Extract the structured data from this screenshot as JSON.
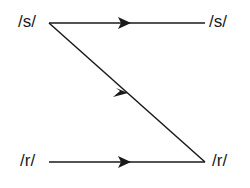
{
  "diagram": {
    "nodes": {
      "s_left": "/s/",
      "s_right": "/s/",
      "r_left": "/r/",
      "r_right": "/r/"
    },
    "edges": [
      {
        "from": "s_left",
        "to": "s_right",
        "direction": "right"
      },
      {
        "from": "s_left",
        "to": "r_right",
        "direction": "down-right"
      },
      {
        "from": "r_left",
        "to": "r_right",
        "direction": "right"
      }
    ],
    "line_color": "#1a1a1a"
  }
}
